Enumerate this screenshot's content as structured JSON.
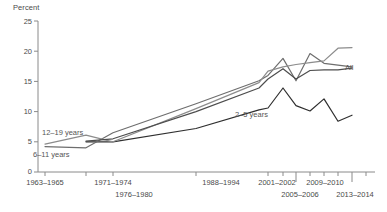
{
  "chart_data": {
    "type": "line",
    "title": "",
    "subtitle": "",
    "ylabel": "Percent",
    "xlabel": "",
    "ylim": [
      0,
      25
    ],
    "yticks": [
      0,
      5,
      10,
      15,
      20,
      25
    ],
    "ytick_labels": [
      "0",
      "5",
      "10",
      "15",
      "20",
      "25"
    ],
    "grid": false,
    "legend_position": "inline-annotations",
    "categories": [
      "1963-1965",
      "1971-1974",
      "1976-1980",
      "1988-1994",
      "1999-2000",
      "2001-2002",
      "2003-2004",
      "2005-2006",
      "2007-2008",
      "2009-2010",
      "2011-2012",
      "2013-2014"
    ],
    "xtick_labels_shown": [
      "1963-1965",
      "1971-1974",
      "1976-1980",
      "1988-1994",
      "2001-2002",
      "2005-2006",
      "2009-2010",
      "2013-2014"
    ],
    "series": [
      {
        "name": "2-5 years",
        "label": "2–5 years",
        "color": "#2f2f2f",
        "values": [
          null,
          5.0,
          5.0,
          7.2,
          10.3,
          10.6,
          13.9,
          11.0,
          10.1,
          12.1,
          8.4,
          9.4
        ]
      },
      {
        "name": "6-11 years",
        "label": "6–11 years",
        "color": "#6e6e6e",
        "values": [
          4.2,
          4.0,
          6.5,
          11.3,
          15.1,
          16.0,
          18.8,
          15.1,
          19.6,
          18.0,
          17.7,
          17.4
        ]
      },
      {
        "name": "12-19 years",
        "label": "12–19 years",
        "color": "#8c8c8c",
        "values": [
          4.6,
          6.1,
          5.0,
          10.5,
          14.8,
          16.7,
          17.4,
          17.8,
          18.1,
          18.4,
          20.5,
          20.6
        ]
      },
      {
        "name": "All",
        "label": "All",
        "color": "#4d4d4d",
        "values": [
          null,
          5.1,
          5.5,
          10.0,
          13.9,
          15.4,
          17.1,
          15.4,
          16.8,
          16.9,
          16.9,
          17.2
        ]
      }
    ],
    "annotations": [
      {
        "text": "12–19 years",
        "series": "12-19 years"
      },
      {
        "text": "6–11 years",
        "series": "6-11 years"
      },
      {
        "text": "2–5 years",
        "series": "2-5 years"
      },
      {
        "text": "All",
        "series": "All"
      }
    ]
  },
  "axis": {
    "y_title": "Percent",
    "y_labels": [
      "25",
      "20",
      "15",
      "10",
      "5",
      "0"
    ],
    "x_labels_upper": [
      "1963–1965",
      "1971–1974",
      "1988–1994",
      "2001–2002",
      "2009–2010"
    ],
    "x_labels_lower": [
      "1976–1980",
      "2005–2006",
      "2013–2014"
    ]
  },
  "labels": {
    "series_12_19": "12–19 years",
    "series_6_11": "6–11 years",
    "series_2_5": "2–5 years",
    "series_all": "All"
  }
}
